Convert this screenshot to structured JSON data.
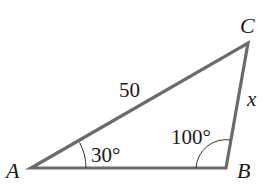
{
  "diagram": {
    "type": "triangle",
    "vertices": {
      "A": {
        "label": "A"
      },
      "B": {
        "label": "B"
      },
      "C": {
        "label": "C"
      }
    },
    "sides": {
      "AC": {
        "label": "50"
      },
      "BC": {
        "label": "x"
      }
    },
    "angles": {
      "A": {
        "label": "30°"
      },
      "B": {
        "label": "100°"
      }
    },
    "colors": {
      "stroke": "#6b6b6b",
      "text": "#1a1a1a"
    }
  }
}
